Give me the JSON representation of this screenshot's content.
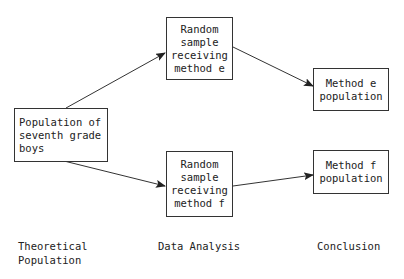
{
  "diagram": {
    "nodes": {
      "population": {
        "lines": [
          "Population of",
          "seventh grade",
          "boys"
        ]
      },
      "sample_e": {
        "lines": [
          "Random",
          "sample",
          "receiving",
          "method e"
        ]
      },
      "sample_f": {
        "lines": [
          "Random",
          "sample",
          "receiving",
          "method f"
        ]
      },
      "result_e": {
        "lines": [
          "Method e",
          "population"
        ]
      },
      "result_f": {
        "lines": [
          "Method f",
          "population"
        ]
      }
    },
    "edges": [
      {
        "from": "population",
        "to": "sample_e"
      },
      {
        "from": "population",
        "to": "sample_f"
      },
      {
        "from": "sample_e",
        "to": "result_e"
      },
      {
        "from": "sample_f",
        "to": "result_f"
      }
    ],
    "stage_labels": {
      "theoretical": [
        "Theoretical",
        "Population"
      ],
      "analysis": [
        "Data Analysis"
      ],
      "conclusion": [
        "Conclusion"
      ]
    },
    "colors": {
      "line": "#333333",
      "background": "#ffffff"
    }
  }
}
